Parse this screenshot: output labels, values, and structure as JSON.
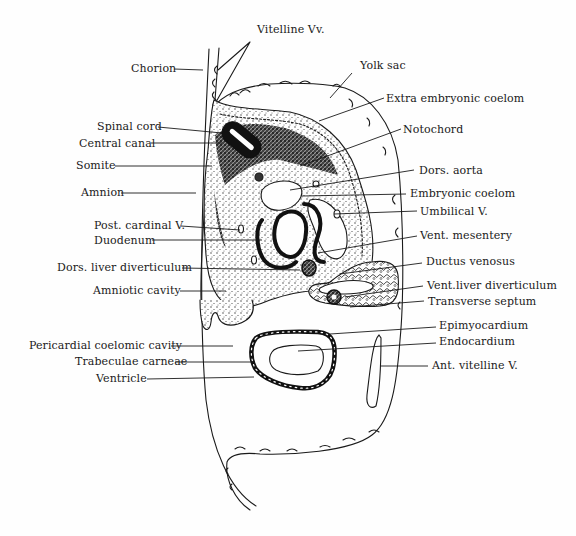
{
  "diagram": {
    "colors": {
      "ink": "#1a1a1a",
      "paper": "#fefefe",
      "stipple": "#3a3a3a"
    },
    "labels": {
      "vitelline_vv": {
        "text": "Vitelline Vv.",
        "x": 257,
        "y": 30
      },
      "chorion": {
        "text": "Chorion",
        "x": 131,
        "y": 67
      },
      "yolk_sac": {
        "text": "Yolk sac",
        "x": 360,
        "y": 62
      },
      "extra_embryonic_coelom": {
        "text": "Extra embryonic coelom",
        "x": 387,
        "y": 94
      },
      "notochord": {
        "text": "Notochord",
        "x": 403,
        "y": 125
      },
      "spinal_cord": {
        "text": "Spinal cord",
        "x": 98,
        "y": 121
      },
      "central_canal": {
        "text": "Central canal",
        "x": 80,
        "y": 139
      },
      "somite": {
        "text": "Somite",
        "x": 76,
        "y": 161
      },
      "dors_aorta": {
        "text": "Dors. aorta",
        "x": 418,
        "y": 167
      },
      "amnion": {
        "text": "Amnion",
        "x": 81,
        "y": 187
      },
      "embryonic_coelom": {
        "text": "Embryonic coelom",
        "x": 410,
        "y": 189
      },
      "umbilical_v": {
        "text": "Umbilical V.",
        "x": 420,
        "y": 207
      },
      "post_cardinal_v": {
        "text": "Post. cardinal V.",
        "x": 94,
        "y": 219
      },
      "duodenum": {
        "text": "Duodenum",
        "x": 94,
        "y": 235
      },
      "vent_mesentery": {
        "text": "Vent. mesentery",
        "x": 420,
        "y": 230
      },
      "dors_liver_diverticulum": {
        "text": "Dors. liver diverticulum",
        "x": 57,
        "y": 262
      },
      "ductus_venosus": {
        "text": "Ductus venosus",
        "x": 426,
        "y": 255
      },
      "amniotic_cavity": {
        "text": "Amniotic cavity",
        "x": 93,
        "y": 285
      },
      "vent_liver_diverticulum": {
        "text": "Vent.liver diverticulum",
        "x": 427,
        "y": 280
      },
      "transverse_septum": {
        "text": "Transverse septum",
        "x": 428,
        "y": 296
      },
      "epimyocardium": {
        "text": "Epimyocardium",
        "x": 440,
        "y": 321
      },
      "pericardial_coelomic_cavity": {
        "text": "Pericardial coelomic cavity",
        "x": 29,
        "y": 341
      },
      "endocardium": {
        "text": "Endocardium",
        "x": 440,
        "y": 336
      },
      "trabeculae_carneae": {
        "text": "Trabeculae carneae",
        "x": 75,
        "y": 356
      },
      "ant_vitelline_v": {
        "text": "Ant. vitelline V.",
        "x": 432,
        "y": 360
      },
      "ventricle": {
        "text": "Ventricle",
        "x": 96,
        "y": 374
      }
    }
  }
}
